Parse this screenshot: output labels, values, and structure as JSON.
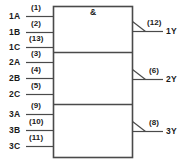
{
  "diagram": {
    "gate_symbol": "&",
    "sections": [
      {
        "inputs": [
          {
            "signal": "1A",
            "pin": "(1)"
          },
          {
            "signal": "1B",
            "pin": "(2)"
          },
          {
            "signal": "1C",
            "pin": "(13)"
          }
        ],
        "output": {
          "signal": "1Y",
          "pin": "(12)"
        }
      },
      {
        "inputs": [
          {
            "signal": "2A",
            "pin": "(3)"
          },
          {
            "signal": "2B",
            "pin": "(4)"
          },
          {
            "signal": "2C",
            "pin": "(5)"
          }
        ],
        "output": {
          "signal": "2Y",
          "pin": "(6)"
        }
      },
      {
        "inputs": [
          {
            "signal": "3A",
            "pin": "(9)"
          },
          {
            "signal": "3B",
            "pin": "(10)"
          },
          {
            "signal": "3C",
            "pin": "(11)"
          }
        ],
        "output": {
          "signal": "3Y",
          "pin": "(8)"
        }
      }
    ],
    "colors": {
      "line": "#4a4a4a",
      "text": "#1a1a1a",
      "background": "#ffffff"
    }
  }
}
